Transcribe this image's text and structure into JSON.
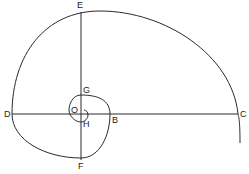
{
  "diagram": {
    "stroke_color": "#2a2a2a",
    "labels": {
      "E": "E",
      "G": "G",
      "O": "O",
      "D": "D",
      "B": "B",
      "C": "C",
      "H": "H",
      "F": "F"
    },
    "points": {
      "O": [
        81,
        114
      ],
      "C": [
        238,
        114
      ],
      "E": [
        81,
        12
      ],
      "D": [
        12,
        114
      ],
      "F": [
        81,
        158
      ],
      "B": [
        110,
        114
      ],
      "G": [
        81,
        95
      ],
      "H": [
        81,
        122
      ]
    }
  }
}
